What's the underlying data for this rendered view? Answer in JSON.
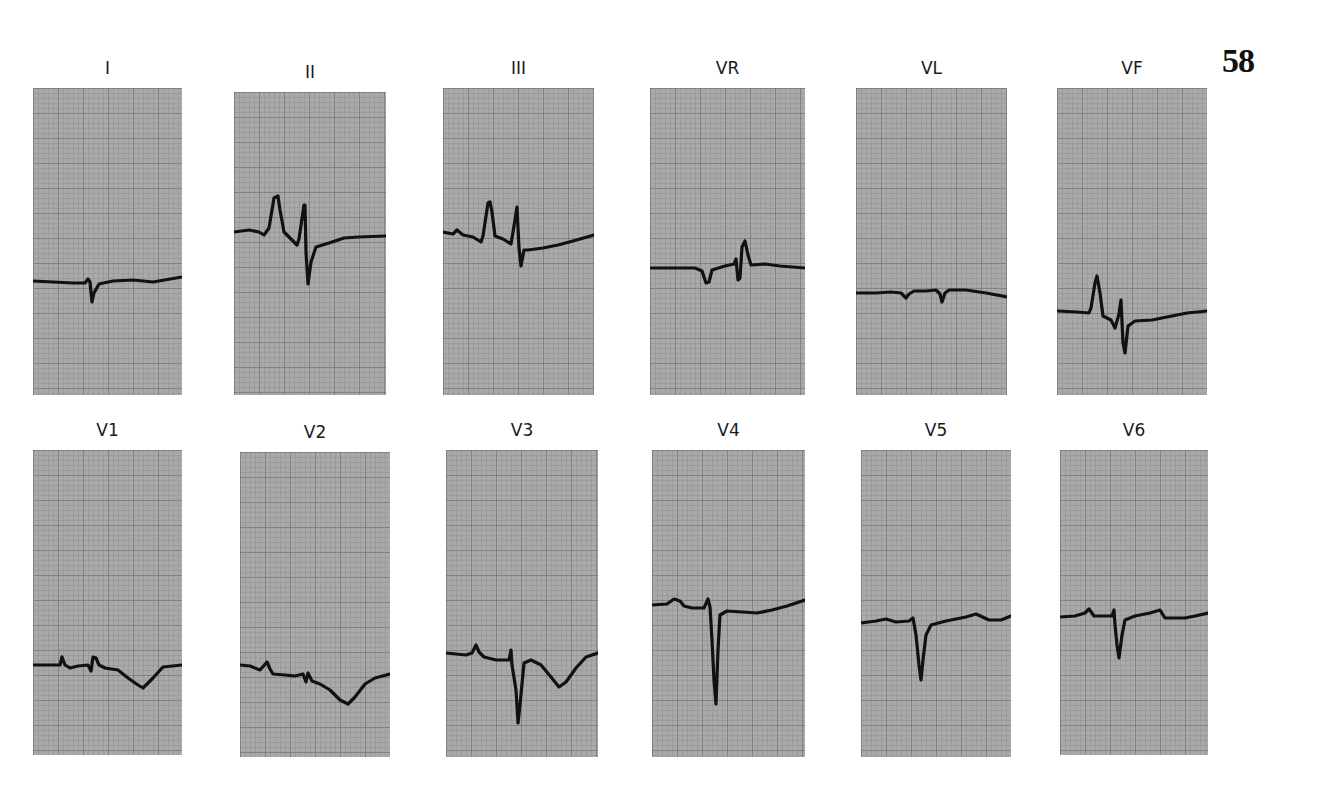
{
  "plate": {
    "number": "58"
  },
  "leads": [
    {
      "id": "I",
      "label": "I",
      "panel": {
        "x": 33,
        "y": 88,
        "w": 149,
        "h": 307
      },
      "trace": [
        [
          0,
          193
        ],
        [
          20,
          194
        ],
        [
          40,
          195
        ],
        [
          52,
          195
        ],
        [
          55,
          191
        ],
        [
          57,
          194
        ],
        [
          59,
          214
        ],
        [
          61,
          205
        ],
        [
          66,
          196
        ],
        [
          80,
          193
        ],
        [
          100,
          192
        ],
        [
          120,
          194
        ],
        [
          149,
          189
        ]
      ]
    },
    {
      "id": "II",
      "label": "II",
      "panel": {
        "x": 234,
        "y": 92,
        "w": 152,
        "h": 303
      },
      "trace": [
        [
          0,
          140
        ],
        [
          15,
          138
        ],
        [
          25,
          140
        ],
        [
          30,
          143
        ],
        [
          35,
          136
        ],
        [
          40,
          106
        ],
        [
          44,
          104
        ],
        [
          46,
          118
        ],
        [
          50,
          140
        ],
        [
          58,
          148
        ],
        [
          63,
          153
        ],
        [
          65,
          147
        ],
        [
          70,
          113
        ],
        [
          71,
          113
        ],
        [
          72,
          160
        ],
        [
          74,
          192
        ],
        [
          77,
          170
        ],
        [
          82,
          155
        ],
        [
          95,
          151
        ],
        [
          110,
          146
        ],
        [
          125,
          145
        ],
        [
          152,
          144
        ]
      ]
    },
    {
      "id": "III",
      "label": "III",
      "panel": {
        "x": 443,
        "y": 88,
        "w": 151,
        "h": 307
      },
      "trace": [
        [
          0,
          144
        ],
        [
          10,
          146
        ],
        [
          14,
          142
        ],
        [
          20,
          147
        ],
        [
          30,
          149
        ],
        [
          38,
          154
        ],
        [
          40,
          148
        ],
        [
          45,
          115
        ],
        [
          47,
          114
        ],
        [
          49,
          124
        ],
        [
          52,
          148
        ],
        [
          60,
          151
        ],
        [
          68,
          156
        ],
        [
          71,
          138
        ],
        [
          74,
          119
        ],
        [
          76,
          160
        ],
        [
          78,
          178
        ],
        [
          81,
          162
        ],
        [
          85,
          162
        ],
        [
          100,
          160
        ],
        [
          115,
          157
        ],
        [
          130,
          153
        ],
        [
          151,
          147
        ]
      ]
    },
    {
      "id": "VR",
      "label": "VR",
      "panel": {
        "x": 650,
        "y": 88,
        "w": 155,
        "h": 307
      },
      "trace": [
        [
          0,
          180
        ],
        [
          20,
          180
        ],
        [
          45,
          180
        ],
        [
          52,
          183
        ],
        [
          56,
          195
        ],
        [
          59,
          194
        ],
        [
          62,
          182
        ],
        [
          75,
          178
        ],
        [
          84,
          176
        ],
        [
          86,
          171
        ],
        [
          88,
          192
        ],
        [
          90,
          190
        ],
        [
          92,
          159
        ],
        [
          95,
          153
        ],
        [
          98,
          167
        ],
        [
          101,
          177
        ],
        [
          115,
          176
        ],
        [
          130,
          178
        ],
        [
          155,
          180
        ]
      ]
    },
    {
      "id": "VL",
      "label": "VL",
      "panel": {
        "x": 856,
        "y": 88,
        "w": 151,
        "h": 307
      },
      "trace": [
        [
          0,
          205
        ],
        [
          20,
          205
        ],
        [
          35,
          204
        ],
        [
          45,
          205
        ],
        [
          50,
          210
        ],
        [
          53,
          206
        ],
        [
          58,
          203
        ],
        [
          70,
          203
        ],
        [
          80,
          202
        ],
        [
          84,
          206
        ],
        [
          86,
          214
        ],
        [
          89,
          205
        ],
        [
          93,
          202
        ],
        [
          110,
          202
        ],
        [
          130,
          205
        ],
        [
          151,
          209
        ]
      ]
    },
    {
      "id": "VF",
      "label": "VF",
      "panel": {
        "x": 1057,
        "y": 88,
        "w": 150,
        "h": 307
      },
      "trace": [
        [
          0,
          223
        ],
        [
          20,
          224
        ],
        [
          32,
          225
        ],
        [
          34,
          220
        ],
        [
          38,
          195
        ],
        [
          40,
          188
        ],
        [
          43,
          205
        ],
        [
          46,
          228
        ],
        [
          54,
          232
        ],
        [
          58,
          240
        ],
        [
          62,
          226
        ],
        [
          64,
          212
        ],
        [
          66,
          255
        ],
        [
          68,
          265
        ],
        [
          71,
          238
        ],
        [
          78,
          233
        ],
        [
          95,
          232
        ],
        [
          115,
          228
        ],
        [
          130,
          225
        ],
        [
          150,
          223
        ]
      ]
    },
    {
      "id": "V1",
      "label": "V1",
      "panel": {
        "x": 33,
        "y": 450,
        "w": 149,
        "h": 305
      },
      "trace": [
        [
          0,
          215
        ],
        [
          20,
          215
        ],
        [
          27,
          215
        ],
        [
          29,
          207
        ],
        [
          32,
          215
        ],
        [
          37,
          218
        ],
        [
          45,
          216
        ],
        [
          55,
          215
        ],
        [
          58,
          221
        ],
        [
          60,
          207
        ],
        [
          63,
          208
        ],
        [
          66,
          215
        ],
        [
          72,
          218
        ],
        [
          85,
          220
        ],
        [
          95,
          228
        ],
        [
          105,
          235
        ],
        [
          110,
          238
        ],
        [
          120,
          228
        ],
        [
          130,
          217
        ],
        [
          149,
          215
        ]
      ]
    },
    {
      "id": "V2",
      "label": "V2",
      "panel": {
        "x": 240,
        "y": 452,
        "w": 150,
        "h": 305
      },
      "trace": [
        [
          0,
          213
        ],
        [
          10,
          214
        ],
        [
          20,
          218
        ],
        [
          27,
          210
        ],
        [
          30,
          217
        ],
        [
          33,
          222
        ],
        [
          45,
          223
        ],
        [
          55,
          224
        ],
        [
          63,
          222
        ],
        [
          66,
          230
        ],
        [
          68,
          221
        ],
        [
          72,
          229
        ],
        [
          80,
          232
        ],
        [
          90,
          238
        ],
        [
          100,
          248
        ],
        [
          108,
          252
        ],
        [
          115,
          245
        ],
        [
          125,
          232
        ],
        [
          135,
          226
        ],
        [
          150,
          222
        ]
      ]
    },
    {
      "id": "V3",
      "label": "V3",
      "panel": {
        "x": 446,
        "y": 450,
        "w": 152,
        "h": 307
      },
      "trace": [
        [
          0,
          203
        ],
        [
          10,
          204
        ],
        [
          20,
          205
        ],
        [
          26,
          203
        ],
        [
          30,
          195
        ],
        [
          33,
          202
        ],
        [
          38,
          207
        ],
        [
          50,
          210
        ],
        [
          63,
          210
        ],
        [
          65,
          200
        ],
        [
          66,
          215
        ],
        [
          70,
          240
        ],
        [
          72,
          273
        ],
        [
          74,
          255
        ],
        [
          78,
          213
        ],
        [
          85,
          210
        ],
        [
          95,
          215
        ],
        [
          105,
          227
        ],
        [
          113,
          237
        ],
        [
          120,
          232
        ],
        [
          130,
          218
        ],
        [
          140,
          207
        ],
        [
          152,
          203
        ]
      ]
    },
    {
      "id": "V4",
      "label": "V4",
      "panel": {
        "x": 652,
        "y": 450,
        "w": 153,
        "h": 307
      },
      "trace": [
        [
          0,
          155
        ],
        [
          15,
          154
        ],
        [
          22,
          149
        ],
        [
          28,
          151
        ],
        [
          32,
          156
        ],
        [
          40,
          158
        ],
        [
          52,
          158
        ],
        [
          56,
          149
        ],
        [
          58,
          157
        ],
        [
          60,
          190
        ],
        [
          62,
          230
        ],
        [
          64,
          254
        ],
        [
          66,
          200
        ],
        [
          68,
          165
        ],
        [
          75,
          161
        ],
        [
          90,
          162
        ],
        [
          105,
          163
        ],
        [
          120,
          160
        ],
        [
          135,
          156
        ],
        [
          153,
          150
        ]
      ]
    },
    {
      "id": "V5",
      "label": "V5",
      "panel": {
        "x": 861,
        "y": 450,
        "w": 150,
        "h": 307
      },
      "trace": [
        [
          0,
          173
        ],
        [
          15,
          171
        ],
        [
          25,
          169
        ],
        [
          35,
          172
        ],
        [
          48,
          171
        ],
        [
          52,
          168
        ],
        [
          55,
          185
        ],
        [
          58,
          215
        ],
        [
          60,
          230
        ],
        [
          62,
          210
        ],
        [
          65,
          185
        ],
        [
          70,
          175
        ],
        [
          85,
          171
        ],
        [
          105,
          167
        ],
        [
          115,
          164
        ],
        [
          128,
          170
        ],
        [
          140,
          170
        ],
        [
          150,
          166
        ]
      ]
    },
    {
      "id": "V6",
      "label": "V6",
      "panel": {
        "x": 1060,
        "y": 450,
        "w": 148,
        "h": 305
      },
      "trace": [
        [
          0,
          167
        ],
        [
          15,
          166
        ],
        [
          25,
          163
        ],
        [
          29,
          159
        ],
        [
          34,
          166
        ],
        [
          45,
          166
        ],
        [
          52,
          166
        ],
        [
          54,
          160
        ],
        [
          55,
          175
        ],
        [
          57,
          195
        ],
        [
          59,
          208
        ],
        [
          62,
          185
        ],
        [
          65,
          170
        ],
        [
          75,
          166
        ],
        [
          90,
          163
        ],
        [
          100,
          160
        ],
        [
          105,
          168
        ],
        [
          115,
          168
        ],
        [
          125,
          168
        ],
        [
          135,
          166
        ],
        [
          148,
          163
        ]
      ]
    }
  ],
  "chart_data": {
    "type": "line",
    "layout": "2 rows x 6 columns of rhythm strips on grey grid paper",
    "grid": true,
    "legend": [],
    "rows": [
      [
        "I",
        "II",
        "III",
        "VR",
        "VL",
        "VF"
      ],
      [
        "V1",
        "V2",
        "V3",
        "V4",
        "V5",
        "V6"
      ]
    ],
    "series": [
      {
        "name": "I",
        "description": "low-amplitude; small negative deflection (Q/S) near complex; near-flat baseline"
      },
      {
        "name": "II",
        "description": "tall peaked P wave, narrow upright R then deep S, depressed ST"
      },
      {
        "name": "III",
        "description": "tall peaked P wave, narrow upright R then S, slight ST depression"
      },
      {
        "name": "VR",
        "description": "inverted P, negative-positive QRS with upright terminal R"
      },
      {
        "name": "VL",
        "description": "very low amplitude complexes near baseline"
      },
      {
        "name": "VF",
        "description": "tall peaked P wave, small R then deep S, downsloping ST"
      },
      {
        "name": "V1",
        "description": "small P and rSr', inverted T wave"
      },
      {
        "name": "V2",
        "description": "small complexes, deep inverted T wave"
      },
      {
        "name": "V3",
        "description": "deep QS/S wave, inverted T wave"
      },
      {
        "name": "V4",
        "description": "very deep narrow S wave, flat T"
      },
      {
        "name": "V5",
        "description": "deep S wave, upright low T"
      },
      {
        "name": "V6",
        "description": "moderate S wave, low upright T"
      }
    ],
    "xlabel": "",
    "ylabel": ""
  }
}
